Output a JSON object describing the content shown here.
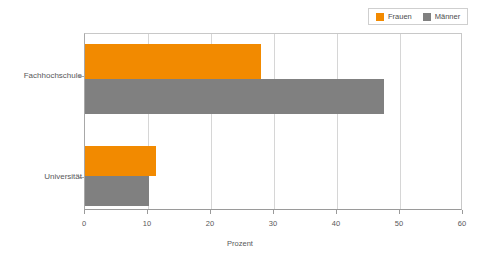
{
  "legend": {
    "position": "top-right",
    "entries": [
      {
        "label": "Frauen",
        "color": "#f28a00",
        "swatch_name": "legend-swatch-frauen"
      },
      {
        "label": "Männer",
        "color": "#808080",
        "swatch_name": "legend-swatch-maenner"
      }
    ]
  },
  "axis": {
    "x_title": "Prozent",
    "x_ticks": [
      "0",
      "10",
      "20",
      "30",
      "40",
      "50",
      "60"
    ]
  },
  "categories": [
    {
      "label": "Fachhochschule"
    },
    {
      "label": "Universität"
    }
  ],
  "chart_data": {
    "type": "bar",
    "orientation": "horizontal",
    "title": "",
    "subtitle": "",
    "xlabel": "Prozent",
    "ylabel": "",
    "xlim": [
      0,
      60
    ],
    "xticks": [
      0,
      10,
      20,
      30,
      40,
      50,
      60
    ],
    "grid": true,
    "legend_position": "top-right",
    "categories": [
      "Fachhochschule",
      "Universität"
    ],
    "series": [
      {
        "name": "Frauen",
        "color": "#f28a00",
        "values": [
          28.0,
          11.2
        ]
      },
      {
        "name": "Männer",
        "color": "#808080",
        "values": [
          47.5,
          10.2
        ]
      }
    ]
  }
}
